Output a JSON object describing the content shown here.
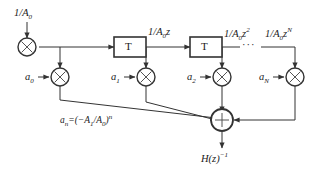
{
  "diagram": {
    "input_label": "1/A",
    "input_sub": "0",
    "output_label": "H(z)",
    "output_sup": "−1",
    "ellipsis": "···",
    "multiply_glyph": "×",
    "sum_glyph": "+",
    "stroke_color": "#333333",
    "text_color": "#1a1a1a",
    "background_color": "#ffffff",
    "coefficient_formula": {
      "lhs": "a",
      "lhs_sub": "n",
      "eq": "=(−A",
      "a1_sub": "1",
      "mid": "/A",
      "a0_sub": "0",
      "rhs": ")",
      "exponent": "n"
    },
    "delay_blocks": [
      {
        "name": "delay-1",
        "label": "T"
      },
      {
        "name": "delay-2",
        "label": "T"
      }
    ],
    "taps": [
      {
        "name": "tap-0",
        "signal_label": "",
        "signal_sub": "",
        "signal_sup": "",
        "coefficient": "a",
        "coefficient_sub": "0"
      },
      {
        "name": "tap-1",
        "signal_label": "1/A",
        "signal_sub": "0",
        "signal_sup_base": "z",
        "signal_sup": "",
        "coefficient": "a",
        "coefficient_sub": "1"
      },
      {
        "name": "tap-2",
        "signal_label": "1/A",
        "signal_sub": "0",
        "signal_sup_base": "z",
        "signal_sup": "2",
        "coefficient": "a",
        "coefficient_sub": "2"
      },
      {
        "name": "tap-n",
        "signal_label": "1/A",
        "signal_sub": "0",
        "signal_sup_base": "z",
        "signal_sup": "N",
        "coefficient": "a",
        "coefficient_sub": "N"
      }
    ]
  }
}
